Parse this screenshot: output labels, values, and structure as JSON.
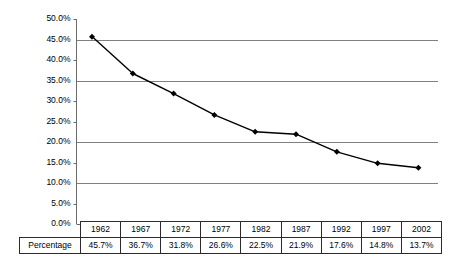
{
  "chart_data": {
    "type": "line",
    "title": "",
    "subtitle": "",
    "xlabel": "",
    "ylabel": "",
    "categories": [
      "1962",
      "1967",
      "1972",
      "1977",
      "1982",
      "1987",
      "1992",
      "1997",
      "2002"
    ],
    "values": [
      45.7,
      36.7,
      31.8,
      26.6,
      22.5,
      21.9,
      17.6,
      14.8,
      13.7
    ],
    "value_labels": [
      "45.7%",
      "36.7%",
      "31.8%",
      "26.6%",
      "22.5%",
      "21.9%",
      "17.6%",
      "14.8%",
      "13.7%"
    ],
    "series": [
      {
        "name": "Percentage",
        "values": [
          45.7,
          36.7,
          31.8,
          26.6,
          22.5,
          21.9,
          17.6,
          14.8,
          13.7
        ]
      }
    ],
    "ylim": [
      0,
      50
    ],
    "ytick_values": [
      0,
      5,
      10,
      15,
      20,
      25,
      30,
      35,
      40,
      45,
      50
    ],
    "ytick_labels": [
      "0.0%",
      "5.0%",
      "10.0%",
      "15.0%",
      "20.0%",
      "25.0%",
      "30.0%",
      "35.0%",
      "40.0%",
      "45.0%",
      "50.0%"
    ],
    "gridline_values": [
      10,
      20,
      35,
      45
    ],
    "grid": true,
    "legend": false,
    "legend_position": "none",
    "marker": "diamond",
    "line_color": "#000000",
    "marker_color": "#000000",
    "grid_color": "#808080",
    "axis_color": "#6b6b6b",
    "background_color": "#ffffff"
  },
  "table": {
    "corner_label": "",
    "header_cells": [
      "1962",
      "1967",
      "1972",
      "1977",
      "1982",
      "1987",
      "1992",
      "1997",
      "2002"
    ],
    "row_label": "Percentage",
    "row_cells": [
      "45.7%",
      "36.7%",
      "31.8%",
      "26.6%",
      "22.5%",
      "21.9%",
      "17.6%",
      "14.8%",
      "13.7%"
    ]
  }
}
